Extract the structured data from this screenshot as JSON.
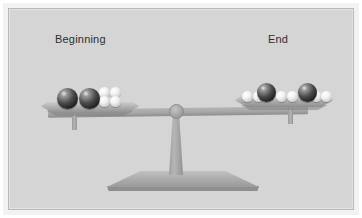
{
  "figure": {
    "background_color": "#d5d5d5",
    "frame_color": "#ffffff",
    "border_color": "#b9b9b9"
  },
  "labels": {
    "left": "Beginning",
    "right": "End"
  },
  "colors": {
    "dark_sphere": "#2a2a2a",
    "white_sphere": "#f2f2f2",
    "beam": "#a6a6a6",
    "stand": "#a8a8a8",
    "text": "#2e2e2e"
  },
  "balance": {
    "state": "balanced",
    "beam_tilt_degrees": -0.8
  },
  "chart_data": {
    "type": "bar",
    "categories": [
      "Beginning",
      "End"
    ],
    "series": [
      {
        "name": "Dark spheres",
        "values": [
          2,
          2
        ]
      },
      {
        "name": "White spheres",
        "values": [
          4,
          6
        ]
      }
    ],
    "xlabel": "",
    "ylabel": "Number of particles",
    "ylim": [
      0,
      8
    ],
    "legend": "right",
    "grid": false
  },
  "pans": {
    "left": {
      "name": "Beginning",
      "dark_count": 2,
      "white_count": 4,
      "dark_spheres": [
        {
          "x": 16,
          "y": 0,
          "d": 21
        },
        {
          "x": 38,
          "y": 0,
          "d": 21
        }
      ],
      "white_spheres": [
        {
          "x": 58,
          "y": -1,
          "d": 11
        },
        {
          "x": 69,
          "y": -1,
          "d": 11
        },
        {
          "x": 58,
          "y": 8,
          "d": 11
        },
        {
          "x": 69,
          "y": 8,
          "d": 11
        }
      ]
    },
    "right": {
      "name": "End",
      "dark_count": 2,
      "white_count": 6,
      "dark_spheres": [
        {
          "x": 22,
          "y": 1,
          "d": 19
        },
        {
          "x": 63,
          "y": 1,
          "d": 19
        }
      ],
      "white_spheres": [
        {
          "x": 7,
          "y": 9,
          "d": 11
        },
        {
          "x": 18,
          "y": 9,
          "d": 11
        },
        {
          "x": 41,
          "y": 9,
          "d": 11
        },
        {
          "x": 52,
          "y": 9,
          "d": 11
        },
        {
          "x": 76,
          "y": 9,
          "d": 11
        },
        {
          "x": 86,
          "y": 9,
          "d": 11
        }
      ]
    }
  }
}
